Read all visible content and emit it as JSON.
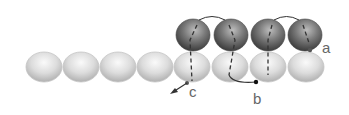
{
  "diagram": {
    "colors": {
      "light_bead_fill": "#e8e8e8",
      "light_bead_shade": "#b8b8b8",
      "dark_bead_fill": "#8c8c8c",
      "dark_bead_shade": "#3e3e3e",
      "thread": "#333333",
      "label": "#666666"
    },
    "bottom_row": {
      "bead_count": 8,
      "centers_x": [
        44,
        81,
        118,
        155,
        192,
        230,
        268,
        306
      ],
      "center_y": 67,
      "rx": 18,
      "ry": 15
    },
    "top_row": {
      "bead_count": 4,
      "centers_x": [
        193,
        231,
        268,
        305
      ],
      "center_y": 35,
      "rx": 17,
      "ry": 16
    },
    "labels": {
      "a": "a",
      "b": "b",
      "c": "c"
    },
    "label_positions": {
      "a": [
        322,
        53
      ],
      "b": [
        253,
        104
      ],
      "c": [
        189,
        97
      ]
    },
    "points": {
      "a": [
        310,
        50
      ],
      "b": [
        256,
        82
      ],
      "c": [
        187,
        83
      ]
    }
  }
}
